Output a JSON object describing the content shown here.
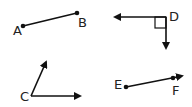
{
  "figures": [
    {
      "id": "segment-AB",
      "type": "segment",
      "labels": [
        "A",
        "B"
      ]
    },
    {
      "id": "right-angle-D",
      "type": "angle",
      "labels": [
        "D"
      ],
      "note": "right angle marker"
    },
    {
      "id": "angle-C",
      "type": "angle",
      "labels": [
        "C"
      ]
    },
    {
      "id": "ray-EF",
      "type": "ray",
      "labels": [
        "E",
        "F"
      ]
    }
  ],
  "labels": {
    "A": "A",
    "B": "B",
    "C": "C",
    "D": "D",
    "E": "E",
    "F": "F"
  },
  "colors": {
    "stroke": "#111111",
    "background": "#ffffff"
  }
}
